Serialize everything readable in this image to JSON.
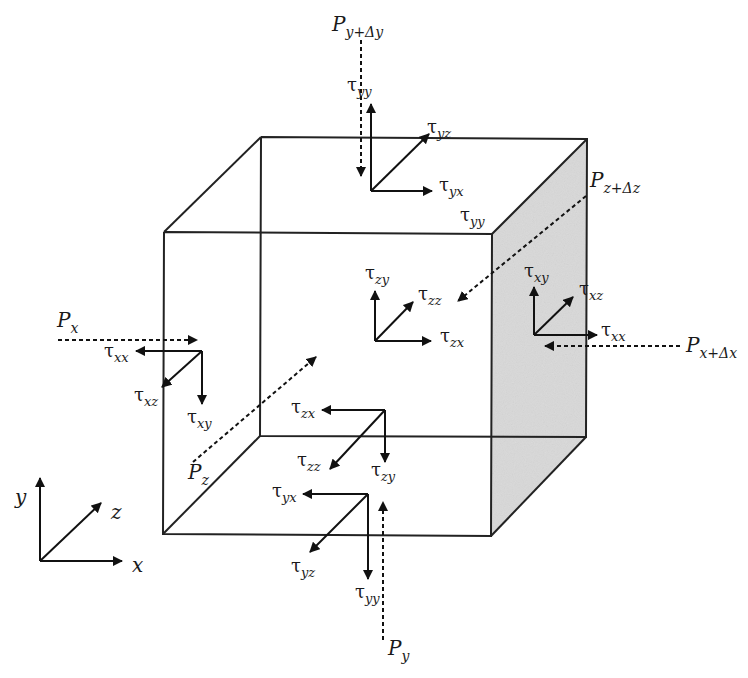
{
  "diagram": {
    "colors": {
      "line": "#222222",
      "shaded_face": "#d9d9d9",
      "background": "#ffffff"
    },
    "cube": {
      "front_face": {
        "tl": [
          164,
          232
        ],
        "tr": [
          492,
          234
        ],
        "br": [
          491,
          536
        ],
        "bl": [
          163,
          534
        ]
      },
      "back_face": {
        "tl": [
          261,
          137
        ],
        "tr": [
          587,
          139
        ],
        "br": [
          586,
          437
        ],
        "bl": [
          260,
          436
        ]
      },
      "shaded_face": "right (x + Δx)"
    },
    "axes": {
      "x_label": "x",
      "y_label": "y",
      "z_label": "z"
    },
    "pressures": {
      "p_y_plus": {
        "base": "P",
        "sub": "y+Δy"
      },
      "p_z_plus": {
        "base": "P",
        "sub": "z+Δz"
      },
      "p_x": {
        "base": "P",
        "sub": "x"
      },
      "p_x_plus": {
        "base": "P",
        "sub": "x+Δx"
      },
      "p_z": {
        "base": "P",
        "sub": "z"
      },
      "p_y": {
        "base": "P",
        "sub": "y"
      }
    },
    "stress_groups": {
      "top_face": {
        "yy_outer": {
          "base": "τ",
          "sub": "yy"
        },
        "yz": {
          "base": "τ",
          "sub": "yz"
        },
        "yx": {
          "base": "τ",
          "sub": "yx"
        },
        "yy_inner": {
          "base": "τ",
          "sub": "yy"
        }
      },
      "front_face": {
        "zy": {
          "base": "τ",
          "sub": "zy"
        },
        "zz": {
          "base": "τ",
          "sub": "zz"
        },
        "zx": {
          "base": "τ",
          "sub": "zx"
        }
      },
      "right_face": {
        "xy": {
          "base": "τ",
          "sub": "xy"
        },
        "xz": {
          "base": "τ",
          "sub": "xz"
        },
        "xx": {
          "base": "τ",
          "sub": "xx"
        }
      },
      "left_face": {
        "xx": {
          "base": "τ",
          "sub": "xx"
        },
        "xz": {
          "base": "τ",
          "sub": "xz"
        },
        "xy": {
          "base": "τ",
          "sub": "xy"
        }
      },
      "back_face": {
        "zx": {
          "base": "τ",
          "sub": "zx"
        },
        "zz": {
          "base": "τ",
          "sub": "zz"
        },
        "zy": {
          "base": "τ",
          "sub": "zy"
        }
      },
      "bottom_face": {
        "yx": {
          "base": "τ",
          "sub": "yx"
        },
        "yz": {
          "base": "τ",
          "sub": "yz"
        },
        "yy": {
          "base": "τ",
          "sub": "yy"
        }
      }
    }
  }
}
